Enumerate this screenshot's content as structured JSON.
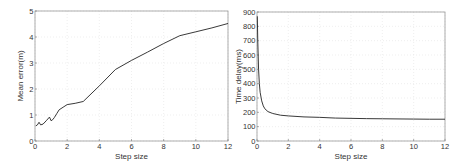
{
  "chart_data": [
    {
      "type": "line",
      "title": "",
      "xlabel": "Step size",
      "ylabel": "Mean error(m)",
      "xlim": [
        0,
        12
      ],
      "ylim": [
        0,
        5
      ],
      "xticks": [
        0,
        2,
        4,
        6,
        8,
        10,
        12
      ],
      "yticks": [
        0,
        1,
        2,
        3,
        4,
        5
      ],
      "grid": true,
      "legend": null,
      "series": [
        {
          "name": "Mean error",
          "color": "#222222",
          "x": [
            0.05,
            0.15,
            0.25,
            0.35,
            0.5,
            0.7,
            0.9,
            1.0,
            1.1,
            1.2,
            1.35,
            1.5,
            1.8,
            2.0,
            2.5,
            3.0,
            4.0,
            5.0,
            6.0,
            7.0,
            8.0,
            9.0,
            10.0,
            11.0,
            12.0
          ],
          "y": [
            0.58,
            0.62,
            0.72,
            0.62,
            0.65,
            0.78,
            0.92,
            0.78,
            0.82,
            0.9,
            1.05,
            1.2,
            1.32,
            1.4,
            1.45,
            1.52,
            2.12,
            2.75,
            3.1,
            3.42,
            3.75,
            4.05,
            4.2,
            4.35,
            4.52
          ]
        }
      ]
    },
    {
      "type": "line",
      "title": "",
      "xlabel": "Step size",
      "ylabel": "Time delay(ms)",
      "xlim": [
        0,
        12
      ],
      "ylim": [
        0,
        900
      ],
      "xticks": [
        0,
        2,
        4,
        6,
        8,
        10,
        12
      ],
      "yticks": [
        0,
        100,
        200,
        300,
        400,
        500,
        600,
        700,
        800,
        900
      ],
      "grid": true,
      "legend": null,
      "series": [
        {
          "name": "Time delay",
          "color": "#222222",
          "x": [
            0.02,
            0.05,
            0.1,
            0.15,
            0.2,
            0.3,
            0.4,
            0.5,
            0.7,
            1.0,
            1.5,
            2.0,
            3.0,
            4.0,
            5.0,
            6.0,
            7.0,
            8.0,
            9.0,
            10.0,
            11.0,
            12.0
          ],
          "y": [
            870,
            700,
            500,
            400,
            340,
            280,
            245,
            225,
            205,
            192,
            180,
            175,
            168,
            165,
            160,
            158,
            156,
            155,
            154,
            153,
            152,
            152
          ]
        }
      ]
    }
  ]
}
